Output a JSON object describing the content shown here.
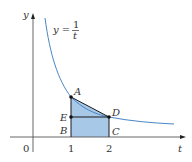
{
  "figure": {
    "equation_lhs": "y =",
    "equation_num": "1",
    "equation_den": "t",
    "y_axis_label": "y",
    "x_axis_label": "t",
    "origin_label": "0",
    "tick_labels": [
      "1",
      "2"
    ],
    "points": {
      "A": "A",
      "B": "B",
      "C": "C",
      "D": "D",
      "E": "E"
    },
    "colors": {
      "curve": "#4a86c5",
      "fill": "#a8c8e8",
      "axis": "#555555",
      "edges": "#1a1a1a"
    }
  }
}
